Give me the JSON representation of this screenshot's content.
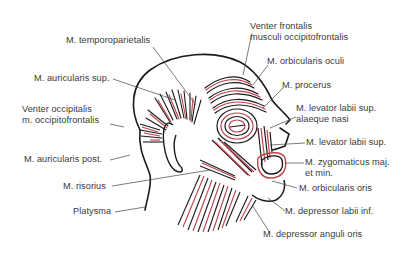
{
  "diagram": {
    "colors": {
      "muscle": "#c0404a",
      "outline": "#1a1a1a",
      "label": "#3a3a3a",
      "background": "#ffffff"
    },
    "labels": {
      "temporoparietalis": "M. temporoparietalis",
      "auricularis_sup": "M. auricularis sup.",
      "venter_occipitalis_1": "Venter occipitalis",
      "venter_occipitalis_2": "m. occipitofrontalis",
      "auricularis_post": "M. auricularis post.",
      "risorius": "M. risorius",
      "platysma": "Platysma",
      "venter_frontalis_1": "Venter frontalis",
      "venter_frontalis_2": "musculi occipitofrontalis",
      "orbicularis_oculi": "M. orbicularis oculi",
      "procerus": "M. procerus",
      "levator_alaeque_1": "M. levator labii sup.",
      "levator_alaeque_2": "alaeque nasi",
      "levator_labii_sup": "M. levator labii sup.",
      "zygomaticus_1": "M. zygomaticus maj.",
      "zygomaticus_2": "et min.",
      "orbicularis_oris": "M. orbicularis oris",
      "depressor_labii_inf": "M. depressor labii inf.",
      "depressor_anguli_oris": "M. depressor anguli oris"
    }
  }
}
